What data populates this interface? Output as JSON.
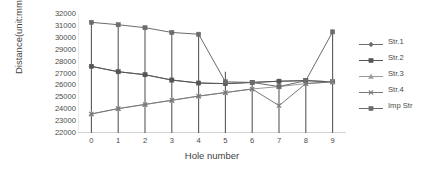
{
  "chart_data": {
    "type": "line",
    "title": "",
    "xlabel": "Hole number",
    "ylabel": "Distance(unit:mm)",
    "x": [
      0,
      1,
      2,
      3,
      4,
      5,
      6,
      7,
      8,
      9
    ],
    "xticklabels": [
      "0",
      "1",
      "2",
      "3",
      "4",
      "5",
      "6",
      "7",
      "8",
      "9"
    ],
    "yticklabels": [
      "32000",
      "31000",
      "30000",
      "29000",
      "28000",
      "27000",
      "26000",
      "25000",
      "24000",
      "23000",
      "22000"
    ],
    "ylim": [
      22000,
      32000
    ],
    "xlim": [
      -0.5,
      9.5
    ],
    "ytick_step": 1000,
    "grid": false,
    "legend_position": "right",
    "series": [
      {
        "name": "Str.1",
        "marker": "diamond",
        "color": "#6e6e6e",
        "values": [
          27600,
          27150,
          26900,
          26450,
          26200,
          26150,
          26250,
          26350,
          26400,
          26300
        ]
      },
      {
        "name": "Str.2",
        "marker": "square",
        "color": "#555555",
        "values": [
          27600,
          27150,
          26900,
          26450,
          26200,
          26150,
          26250,
          26350,
          26400,
          26300
        ]
      },
      {
        "name": "Str.3",
        "marker": "triangle",
        "color": "#9a9a9a",
        "values": [
          23600,
          24050,
          24400,
          24750,
          25100,
          25400,
          25700,
          25900,
          26150,
          26300
        ]
      },
      {
        "name": "Str.4",
        "marker": "cross",
        "color": "#787878",
        "values": [
          23600,
          24050,
          24400,
          24750,
          25100,
          25400,
          25700,
          24300,
          26150,
          26300
        ]
      },
      {
        "name": "Imp Str",
        "marker": "square",
        "color": "#6b6b6b",
        "values": [
          31300,
          31100,
          30850,
          30450,
          30300,
          26300,
          26250,
          25900,
          26400,
          30500
        ]
      }
    ],
    "range_bars": [
      {
        "x": 0,
        "low": 22000,
        "high": 31300
      },
      {
        "x": 1,
        "low": 22000,
        "high": 31100
      },
      {
        "x": 2,
        "low": 22000,
        "high": 30850
      },
      {
        "x": 3,
        "low": 22000,
        "high": 30450
      },
      {
        "x": 4,
        "low": 22000,
        "high": 30300
      },
      {
        "x": 5,
        "low": 22000,
        "high": 27150
      },
      {
        "x": 6,
        "low": 22000,
        "high": 26400
      },
      {
        "x": 7,
        "low": 22000,
        "high": 26500
      },
      {
        "x": 8,
        "low": 22000,
        "high": 26550
      },
      {
        "x": 9,
        "low": 22000,
        "high": 30500
      }
    ]
  },
  "legend": {
    "items": [
      {
        "label": "Str.1"
      },
      {
        "label": "Str.2"
      },
      {
        "label": "Str.3"
      },
      {
        "label": "Str.4"
      },
      {
        "label": "Imp Str"
      }
    ]
  }
}
